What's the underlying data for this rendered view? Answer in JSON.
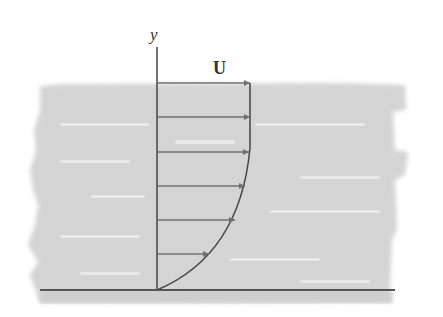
{
  "diagram": {
    "type": "velocity-profile",
    "axis_label": "y",
    "freestream_label": "U",
    "colors": {
      "fluid": "#d4d4d4",
      "fluid_streak": "#ececec",
      "lines": "#444444",
      "arrow": "#707070",
      "ground": "#555555"
    },
    "arrows": [
      {
        "y": 83,
        "length": 93
      },
      {
        "y": 117,
        "length": 93
      },
      {
        "y": 152,
        "length": 92
      },
      {
        "y": 186,
        "length": 88
      },
      {
        "y": 220,
        "length": 78
      },
      {
        "y": 254,
        "length": 52
      }
    ]
  }
}
